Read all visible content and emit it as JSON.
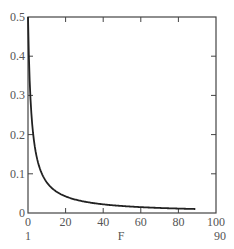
{
  "chart_data": {
    "type": "line",
    "title": "",
    "xlabel": "F",
    "ylabel": "",
    "xlim": [
      0,
      100
    ],
    "ylim": [
      0,
      0.5
    ],
    "x_ticks": [
      "0",
      "20",
      "40",
      "60",
      "80",
      "100"
    ],
    "y_ticks": [
      "0",
      "0.1",
      "0.2",
      "0.3",
      "0.4",
      "0.5"
    ],
    "x_range_annotation": {
      "start": "1",
      "end": "90"
    },
    "grid": false,
    "legend": null,
    "series": [
      {
        "name": "curve",
        "color": "#222222",
        "x": [
          1,
          2,
          3,
          4,
          5,
          6,
          8,
          10,
          12,
          15,
          18,
          20,
          25,
          30,
          35,
          40,
          50,
          60,
          70,
          80,
          90
        ],
        "values": [
          0.5,
          0.32,
          0.24,
          0.19,
          0.155,
          0.13,
          0.1,
          0.083,
          0.07,
          0.058,
          0.049,
          0.045,
          0.036,
          0.03,
          0.026,
          0.023,
          0.018,
          0.015,
          0.013,
          0.011,
          0.01
        ]
      }
    ]
  },
  "axis": {
    "x_label": "F",
    "x_start_annotation": "1",
    "x_end_annotation": "90"
  }
}
